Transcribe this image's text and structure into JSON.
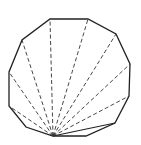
{
  "diagram": {
    "type": "polygon-triangulation",
    "sides": 12,
    "colors": {
      "edge": "#222222",
      "diagonal": "#333333",
      "background": "#ffffff"
    },
    "apex": [
      53,
      136
    ],
    "vertices": [
      [
        53,
        136
      ],
      [
        86,
        136
      ],
      [
        115,
        123
      ],
      [
        129,
        96
      ],
      [
        130,
        64
      ],
      [
        116,
        34
      ],
      [
        88,
        19
      ],
      [
        50,
        19
      ],
      [
        22,
        40
      ],
      [
        9,
        72
      ],
      [
        9,
        106
      ],
      [
        26,
        127
      ]
    ],
    "solid_diagonals": [
      [
        115,
        123
      ]
    ],
    "dashed_diagonals": [
      [
        129,
        96
      ],
      [
        130,
        64
      ],
      [
        116,
        34
      ],
      [
        88,
        19
      ],
      [
        50,
        19
      ],
      [
        22,
        40
      ],
      [
        9,
        72
      ],
      [
        9,
        106
      ]
    ]
  }
}
